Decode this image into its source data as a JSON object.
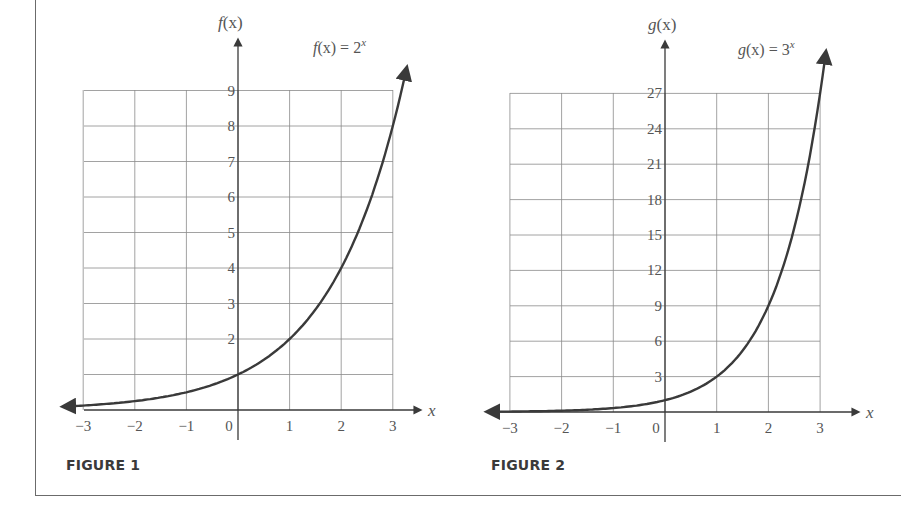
{
  "chart_data": [
    {
      "type": "line",
      "title": "",
      "caption": "FIGURE 1",
      "function_label": "f(x) = 2^x",
      "xlabel": "x",
      "ylabel": "f(x)",
      "x_ticks": [
        "−3",
        "−2",
        "−1",
        "0",
        "1",
        "2",
        "3"
      ],
      "y_ticks": [
        "2",
        "3",
        "4",
        "5",
        "6",
        "7",
        "8",
        "9"
      ],
      "xlim": [
        -3,
        3
      ],
      "ylim": [
        0,
        9
      ],
      "grid": true,
      "series": [
        {
          "name": "f(x) = 2^x",
          "x": [
            -3,
            -2,
            -1,
            0,
            1,
            2,
            3
          ],
          "y": [
            0.125,
            0.25,
            0.5,
            1,
            2,
            4,
            8
          ]
        }
      ]
    },
    {
      "type": "line",
      "title": "",
      "caption": "FIGURE 2",
      "function_label": "g(x) = 3^x",
      "xlabel": "x",
      "ylabel": "g(x)",
      "x_ticks": [
        "−3",
        "−2",
        "−1",
        "0",
        "1",
        "2",
        "3"
      ],
      "y_ticks": [
        "3",
        "6",
        "9",
        "12",
        "15",
        "18",
        "21",
        "24",
        "27"
      ],
      "xlim": [
        -3,
        3
      ],
      "ylim": [
        0,
        27
      ],
      "grid": true,
      "series": [
        {
          "name": "g(x) = 3^x",
          "x": [
            -3,
            -2,
            -1,
            0,
            1,
            2,
            3
          ],
          "y": [
            0.037,
            0.111,
            0.333,
            1,
            3,
            9,
            27
          ]
        }
      ]
    }
  ],
  "fig1": {
    "caption": "FIGURE 1",
    "ylabel_fn": "f",
    "ylabel_arg": "(x)",
    "eq_lhs_fn": "f",
    "eq_lhs_rest": "(x) = 2",
    "eq_exp": "x",
    "xlabel": "x",
    "xticks": [
      "−3",
      "−2",
      "−1",
      "0",
      "1",
      "2",
      "3"
    ],
    "yticks": [
      "2",
      "3",
      "4",
      "5",
      "6",
      "7",
      "8",
      "9"
    ]
  },
  "fig2": {
    "caption": "FIGURE 2",
    "ylabel_fn": "g",
    "ylabel_arg": "(x)",
    "eq_lhs_fn": "g",
    "eq_lhs_rest": "(x) = 3",
    "eq_exp": "x",
    "xlabel": "x",
    "xticks": [
      "−3",
      "−2",
      "−1",
      "0",
      "1",
      "2",
      "3"
    ],
    "yticks": [
      "3",
      "6",
      "9",
      "12",
      "15",
      "18",
      "21",
      "24",
      "27"
    ]
  },
  "colors": {
    "curve": "#3a3a3a",
    "grid": "#8a8a8a",
    "axis": "#3a3a3a",
    "text": "#555555"
  }
}
